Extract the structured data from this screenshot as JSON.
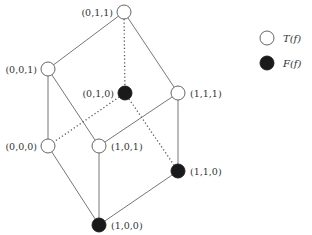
{
  "diagram": {
    "type": "boolean-lattice-cube",
    "nodes": [
      {
        "id": "011",
        "label": "(0,1,1)",
        "value": "T",
        "x": 124,
        "y": 12,
        "label_side": "left"
      },
      {
        "id": "001",
        "label": "(0,0,1)",
        "value": "T",
        "x": 48,
        "y": 69,
        "label_side": "left"
      },
      {
        "id": "010",
        "label": "(0,1,0)",
        "value": "F",
        "x": 125,
        "y": 93,
        "label_side": "left"
      },
      {
        "id": "111",
        "label": "(1,1,1)",
        "value": "T",
        "x": 178,
        "y": 93,
        "label_side": "right"
      },
      {
        "id": "000",
        "label": "(0,0,0)",
        "value": "T",
        "x": 48,
        "y": 146,
        "label_side": "left"
      },
      {
        "id": "101",
        "label": "(1,0,1)",
        "value": "T",
        "x": 99,
        "y": 146,
        "label_side": "right"
      },
      {
        "id": "110",
        "label": "(1,1,0)",
        "value": "F",
        "x": 178,
        "y": 171,
        "label_side": "right"
      },
      {
        "id": "100",
        "label": "(1,0,0)",
        "value": "F",
        "x": 99,
        "y": 225,
        "label_side": "right"
      }
    ],
    "edges": [
      {
        "from": "011",
        "to": "001",
        "style": "solid"
      },
      {
        "from": "011",
        "to": "111",
        "style": "solid"
      },
      {
        "from": "011",
        "to": "010",
        "style": "dotted"
      },
      {
        "from": "001",
        "to": "000",
        "style": "solid"
      },
      {
        "from": "001",
        "to": "101",
        "style": "solid"
      },
      {
        "from": "010",
        "to": "000",
        "style": "dotted"
      },
      {
        "from": "010",
        "to": "110",
        "style": "dotted"
      },
      {
        "from": "111",
        "to": "101",
        "style": "solid"
      },
      {
        "from": "111",
        "to": "110",
        "style": "solid"
      },
      {
        "from": "000",
        "to": "100",
        "style": "solid"
      },
      {
        "from": "101",
        "to": "100",
        "style": "solid"
      },
      {
        "from": "110",
        "to": "100",
        "style": "solid"
      }
    ]
  },
  "legend": {
    "items": [
      {
        "symbol": "open-circle",
        "label": "T(f)"
      },
      {
        "symbol": "filled-circle",
        "label": "F(f)"
      }
    ]
  },
  "colors": {
    "open_fill": "#ffffff",
    "filled": "#1a1a1a",
    "edge": "#666666"
  }
}
